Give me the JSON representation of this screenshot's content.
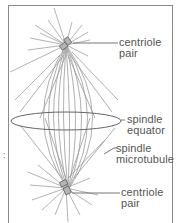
{
  "diagram": {
    "type": "mitotic spindle",
    "labels": {
      "top_centriole": [
        "centriole",
        "pair"
      ],
      "equator": [
        "spindle",
        "equator"
      ],
      "microtubule": [
        "spindle",
        "microtubule"
      ],
      "bottom_centriole": [
        "centriole",
        "pair"
      ]
    },
    "side_mark": ":",
    "colors": {
      "line": "#8a8a8a",
      "text": "#555555",
      "centriole": "#9a9a9a"
    }
  }
}
